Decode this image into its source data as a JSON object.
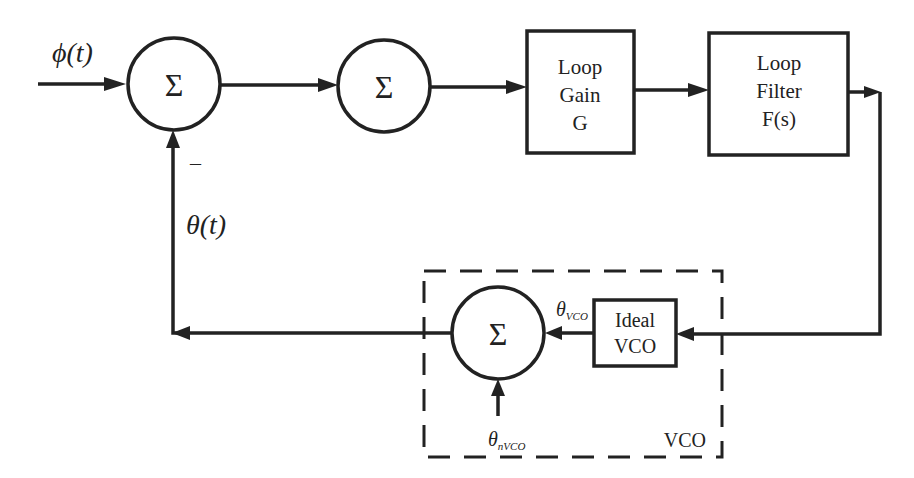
{
  "diagram": {
    "signals": {
      "input": "ϕ(t)",
      "feedback": "θ(t)",
      "feedback_sign": "–",
      "vco_out": "θ",
      "vco_out_sub": "VCO",
      "vco_noise": "θ",
      "vco_noise_sub": "nVCO"
    },
    "summers": [
      {
        "id": "sum1",
        "symbol": "Σ"
      },
      {
        "id": "sum2",
        "symbol": "Σ"
      },
      {
        "id": "sum3",
        "symbol": "Σ"
      }
    ],
    "blocks": {
      "loop_gain": {
        "line1": "Loop",
        "line2": "Gain",
        "line3": "G"
      },
      "loop_filter": {
        "line1": "Loop",
        "line2": "Filter",
        "line3": "F(s)"
      },
      "ideal_vco": {
        "line1": "Ideal",
        "line2": "VCO"
      }
    },
    "group": {
      "label": "VCO"
    },
    "colors": {
      "stroke": "#222222",
      "background": "#ffffff"
    }
  }
}
